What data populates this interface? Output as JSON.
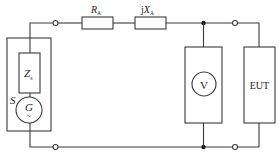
{
  "diagram": {
    "type": "circuit",
    "components": {
      "source_label": "S",
      "source_impedance": {
        "main": "Z",
        "sub": "s"
      },
      "generator": {
        "main": "G",
        "tilde": "~"
      },
      "resistor": {
        "main": "R",
        "sub": "A"
      },
      "reactance": {
        "prefix": "j",
        "main": "X",
        "sub": "A"
      },
      "voltmeter": "V",
      "eut": "EUT"
    },
    "colors": {
      "line": "#3a3a3a",
      "junction": "#1a1a1a",
      "background": "#ffffff"
    }
  }
}
